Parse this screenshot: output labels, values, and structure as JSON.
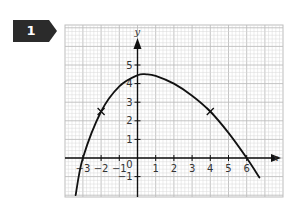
{
  "question": {
    "number": "1",
    "badge_color": "#2b2b2b"
  },
  "chart_data": {
    "type": "line",
    "title": "",
    "xlabel": "x",
    "ylabel": "y",
    "xlim": [
      -3.9,
      7.9
    ],
    "ylim": [
      -2.1,
      7.2
    ],
    "grid": true,
    "x_ticks": [
      -3,
      -2,
      -1,
      0,
      1,
      2,
      3,
      4,
      5,
      6
    ],
    "x_tick_labels": [
      "−3",
      "−2",
      "−1",
      "0",
      "1",
      "2",
      "3",
      "4",
      "5",
      "6"
    ],
    "y_ticks": [
      -1,
      1,
      2,
      3,
      4,
      5
    ],
    "y_tick_labels": [
      "−1",
      "1",
      "2",
      "3",
      "4",
      "5"
    ],
    "series": [
      {
        "name": "curve",
        "x": [
          -3.4,
          -3,
          -2,
          -1,
          0,
          0.5,
          1,
          2,
          3,
          4,
          5,
          6,
          6.7
        ],
        "y": [
          -2.0,
          0,
          2.5,
          3.85,
          4.45,
          4.5,
          4.42,
          4.0,
          3.35,
          2.5,
          1.35,
          0,
          -1.05
        ],
        "color": "#111111"
      }
    ],
    "marked_points": [
      {
        "x": -2,
        "y": 2.5,
        "marker": "cross"
      },
      {
        "x": 4,
        "y": 2.5,
        "marker": "cross"
      }
    ],
    "x_intercepts": [
      -3,
      6
    ],
    "colors": {
      "grid_minor": "#d9d9d9",
      "grid_major": "#bdbdbd",
      "axis": "#111111"
    }
  }
}
